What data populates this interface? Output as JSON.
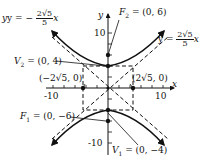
{
  "diagram": {
    "type": "hyperbola",
    "axes": {
      "x_label": "x",
      "y_label": "y",
      "x_tick_labels": [
        "-10",
        "10"
      ],
      "y_tick_labels": [
        "10",
        "-10"
      ]
    },
    "asymptotes": [
      {
        "prefix": "y = −",
        "num": "2√5",
        "den": "5",
        "suffix": "x"
      },
      {
        "prefix": "y = ",
        "num": "2√5",
        "den": "5",
        "suffix": "x"
      }
    ],
    "foci": [
      {
        "name": "F",
        "sub": "2",
        "value": " = (0, 6)"
      },
      {
        "name": "F",
        "sub": "1",
        "value": " = (0, −6)"
      }
    ],
    "vertices": [
      {
        "name": "V",
        "sub": "2",
        "value": " = (0, 4)"
      },
      {
        "name": "V",
        "sub": "1",
        "value": " = (0, −4)"
      }
    ],
    "co_vertices": [
      {
        "label": "(−2√5, 0)"
      },
      {
        "label": "(2√5, 0)"
      }
    ]
  }
}
